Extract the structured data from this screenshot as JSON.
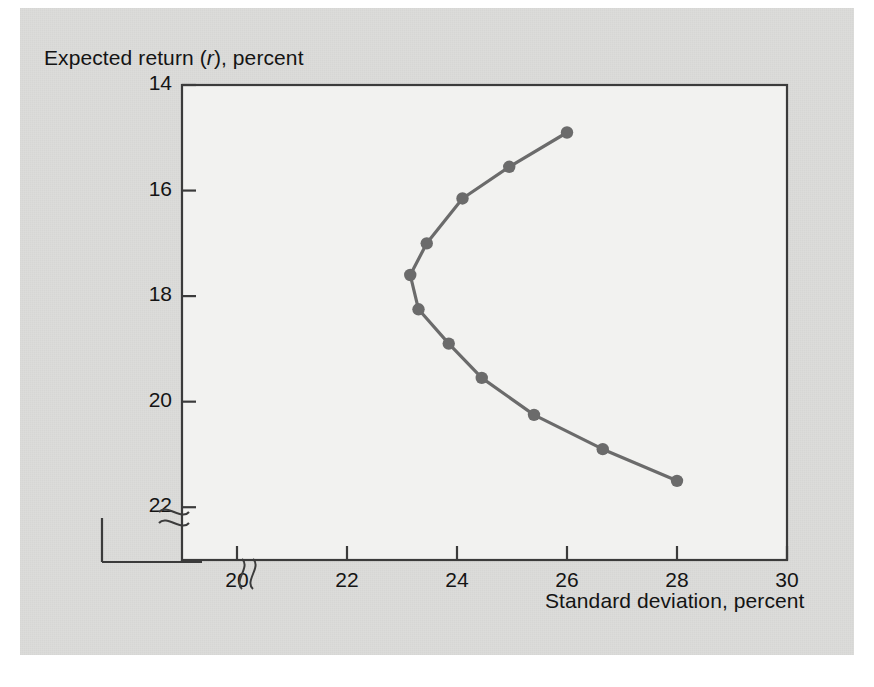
{
  "figure": {
    "background_color": "#dcdcda",
    "plot_area_color": "#f2f2f0",
    "frame_color": "#3b3b3b",
    "curve_color": "#6b6b6b",
    "marker_color": "#6b6b6b"
  },
  "axes": {
    "y_title_prefix": "Expected return (",
    "y_title_symbol": "r",
    "y_title_suffix": "), percent",
    "x_title": "Standard deviation, percent",
    "y_ticks": [
      "22",
      "20",
      "18",
      "16",
      "14"
    ],
    "x_ticks": [
      "20",
      "22",
      "24",
      "26",
      "28",
      "30"
    ],
    "y_axis_break": "axis-break-squiggle",
    "x_axis_break": "axis-break-squiggle"
  },
  "chart_data": {
    "type": "line",
    "title": "",
    "xlabel": "Standard deviation, percent",
    "ylabel": "Expected return (r), percent",
    "xlim": [
      19.0,
      30.0
    ],
    "ylim": [
      13.0,
      22.0
    ],
    "xticks": [
      20,
      22,
      24,
      26,
      28,
      30
    ],
    "yticks": [
      14,
      16,
      18,
      20,
      22
    ],
    "grid": false,
    "legend": null,
    "axis_break": {
      "x": true,
      "y": true
    },
    "series": [
      {
        "name": "Efficient frontier / portfolio set",
        "markers": true,
        "x": [
          26.0,
          24.95,
          24.1,
          23.45,
          23.15,
          23.3,
          23.85,
          24.45,
          25.4,
          26.65,
          28.0
        ],
        "y": [
          21.1,
          20.45,
          19.85,
          19.0,
          18.4,
          17.75,
          17.1,
          16.45,
          15.75,
          15.1,
          14.5
        ]
      }
    ]
  }
}
